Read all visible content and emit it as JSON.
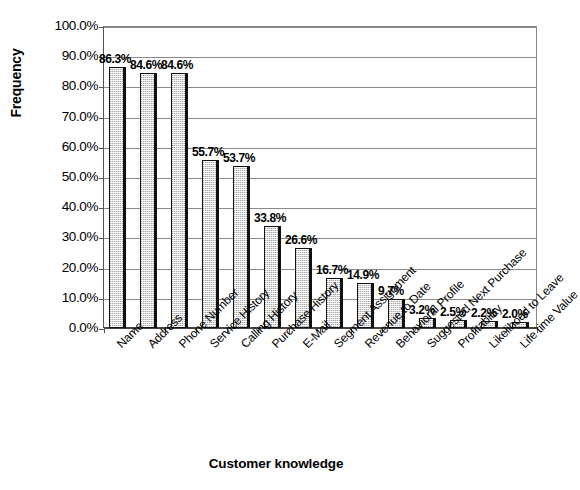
{
  "chart_data": {
    "type": "bar",
    "title": "",
    "xlabel": "Customer knowledge",
    "ylabel": "Frequency",
    "ylim": [
      0,
      100
    ],
    "ytick_step": 10,
    "grid": "horizontal",
    "legend": "none",
    "value_suffix": "%",
    "categories": [
      "Name",
      "Address",
      "Phone Number",
      "Service History",
      "Calling History",
      "Purchase History",
      "E-Mail",
      "Segment Assignment",
      "Revenue to Date",
      "Behavioral Profile",
      "Suggested Next Purchase",
      "Profitability",
      "Likelihood to Leave",
      "Life time Value"
    ],
    "values": [
      86.3,
      84.6,
      84.6,
      55.7,
      53.7,
      33.8,
      26.6,
      16.7,
      14.9,
      9.7,
      3.2,
      2.5,
      2.2,
      2.0
    ],
    "data_labels": [
      "86.3%",
      "84.6%",
      "84.6%",
      "55.7%",
      "53.7%",
      "33.8%",
      "26.6%",
      "16.7%",
      "14.9%",
      "9.7%",
      "3.2%",
      "2.5%",
      "2.2%",
      "2.0%"
    ],
    "ytick_labels": [
      "0.0%",
      "10.0%",
      "20.0%",
      "30.0%",
      "40.0%",
      "50.0%",
      "60.0%",
      "70.0%",
      "80.0%",
      "90.0%",
      "100.0%"
    ],
    "ytick_values": [
      0,
      10,
      20,
      30,
      40,
      50,
      60,
      70,
      80,
      90,
      100
    ],
    "colors": {
      "background": "#ffffff",
      "bar_fill": "#dedede",
      "bar_outline": "#111111",
      "bar_shadow": "#101010",
      "gridline": "#8a8a8a",
      "axis": "#555555",
      "text": "#000000"
    }
  }
}
